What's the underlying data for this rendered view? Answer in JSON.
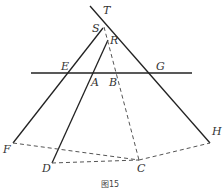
{
  "caption": "图15",
  "labels": {
    "T": "T",
    "S": "S",
    "R": "R",
    "E": "E",
    "A": "A",
    "B": "B",
    "G": "G",
    "F": "F",
    "D": "D",
    "C": "C",
    "H": "H"
  },
  "colors": {
    "line": "#222222",
    "dashed": "#555555",
    "background": "#ffffff"
  }
}
